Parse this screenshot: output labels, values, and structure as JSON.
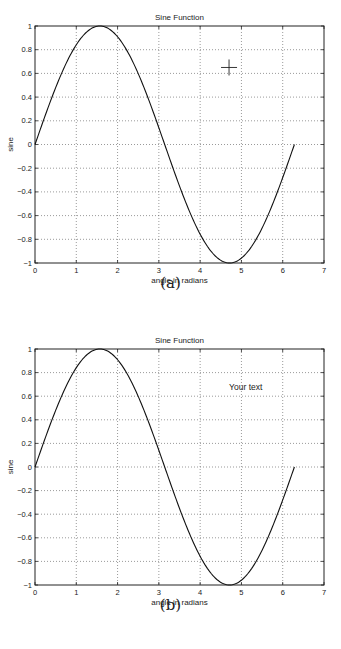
{
  "figures": [
    {
      "id": "a",
      "caption": "(a)",
      "title": "Sine Function",
      "xlabel": "angle in radians",
      "ylabel": "sine",
      "annotation": {
        "type": "crosshair-cursor",
        "x": 4.7,
        "y": 0.65
      }
    },
    {
      "id": "b",
      "caption": "(b)",
      "title": "Sine Function",
      "xlabel": "angle in radians",
      "ylabel": "sine",
      "annotation": {
        "type": "text",
        "text": "Your text",
        "x": 4.75,
        "y": 0.68
      }
    }
  ],
  "axes": {
    "xticks": [
      "0",
      "1",
      "2",
      "3",
      "4",
      "5",
      "6",
      "7"
    ],
    "yticks": [
      "1",
      "0.8",
      "0.6",
      "0.4",
      "0.2",
      "0",
      "−0.2",
      "−0.4",
      "−0.6",
      "−0.8",
      "−1"
    ]
  },
  "chart_data": [
    {
      "type": "line",
      "title": "Sine Function",
      "xlabel": "angle in radians",
      "ylabel": "sine",
      "xlim": [
        0,
        7
      ],
      "ylim": [
        -1,
        1
      ],
      "grid": true,
      "series": [
        {
          "name": "sin(x)",
          "function": "sin(x)",
          "x_range": [
            0,
            6.2832
          ]
        }
      ],
      "x": [
        0,
        0.5,
        1,
        1.5708,
        2,
        2.5,
        3,
        3.1416,
        3.5,
        4,
        4.5,
        4.7124,
        5,
        5.5,
        6,
        6.2832
      ],
      "y": [
        0,
        0.479,
        0.841,
        1,
        0.909,
        0.598,
        0.141,
        0,
        -0.351,
        -0.757,
        -0.978,
        -1,
        -0.959,
        -0.706,
        -0.279,
        0
      ],
      "annotations": [
        {
          "type": "crosshair-cursor",
          "x": 4.7,
          "y": 0.65
        }
      ]
    },
    {
      "type": "line",
      "title": "Sine Function",
      "xlabel": "angle in radians",
      "ylabel": "sine",
      "xlim": [
        0,
        7
      ],
      "ylim": [
        -1,
        1
      ],
      "grid": true,
      "series": [
        {
          "name": "sin(x)",
          "function": "sin(x)",
          "x_range": [
            0,
            6.2832
          ]
        }
      ],
      "x": [
        0,
        0.5,
        1,
        1.5708,
        2,
        2.5,
        3,
        3.1416,
        3.5,
        4,
        4.5,
        4.7124,
        5,
        5.5,
        6,
        6.2832
      ],
      "y": [
        0,
        0.479,
        0.841,
        1,
        0.909,
        0.598,
        0.141,
        0,
        -0.351,
        -0.757,
        -0.978,
        -1,
        -0.959,
        -0.706,
        -0.279,
        0
      ],
      "annotations": [
        {
          "type": "text",
          "text": "Your text",
          "x": 4.75,
          "y": 0.68
        }
      ]
    }
  ]
}
